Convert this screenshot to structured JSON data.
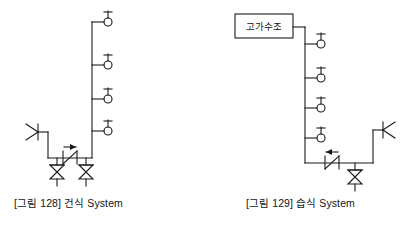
{
  "page": {
    "width": 410,
    "height": 226,
    "background": "#ffffff",
    "line_color": "#1a1a1a",
    "text_color": "#141414"
  },
  "figures": [
    {
      "id": "dry-system",
      "caption": "[그림 128] 건식 System",
      "caption_number": "128",
      "caption_name": "건식 System",
      "riser": {
        "x": 92,
        "y_top": 22,
        "y_bottom": 158
      },
      "sprinkler_heads": [
        {
          "label": "sprinkler-head-1",
          "branch_y": 22,
          "head_x": 108
        },
        {
          "label": "sprinkler-head-2",
          "branch_y": 65,
          "head_x": 108
        },
        {
          "label": "sprinkler-head-3",
          "branch_y": 99,
          "head_x": 108
        },
        {
          "label": "sprinkler-head-4",
          "branch_y": 131,
          "head_x": 108
        }
      ],
      "nozzle": {
        "x": 32,
        "y": 132,
        "orientation": "left"
      },
      "header_pipe": {
        "y": 158,
        "x_left": 48,
        "x_right": 92
      },
      "check_valve": {
        "x": 70,
        "y": 158,
        "arrow_direction": "right"
      },
      "gate_valves": [
        {
          "label": "gate-valve-left",
          "x": 57,
          "y": 172
        },
        {
          "label": "gate-valve-right",
          "x": 86,
          "y": 172
        }
      ],
      "tank": null
    },
    {
      "id": "wet-system",
      "caption": "[그림 129] 습식 System",
      "caption_number": "129",
      "caption_name": "습식 System",
      "riser": {
        "x": 305,
        "y_top": 27,
        "y_bottom": 163
      },
      "sprinkler_heads": [
        {
          "label": "sprinkler-head-1",
          "branch_y": 44,
          "head_x": 321
        },
        {
          "label": "sprinkler-head-2",
          "branch_y": 78,
          "head_x": 321
        },
        {
          "label": "sprinkler-head-3",
          "branch_y": 108,
          "head_x": 321
        },
        {
          "label": "sprinkler-head-4",
          "branch_y": 138,
          "head_x": 321
        }
      ],
      "nozzle": {
        "x": 385,
        "y": 130,
        "orientation": "right"
      },
      "header_pipe": {
        "y": 163,
        "x_left": 305,
        "x_right": 373
      },
      "check_valve": {
        "x": 332,
        "y": 163,
        "arrow_direction": "left"
      },
      "gate_valves": [
        {
          "label": "gate-valve-bottom",
          "x": 355,
          "y": 177
        }
      ],
      "tank": {
        "label": "고가수조",
        "x": 235,
        "y": 14,
        "width": 58,
        "height": 24
      }
    }
  ]
}
